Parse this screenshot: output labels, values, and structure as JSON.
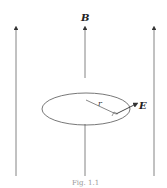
{
  "diagram": {
    "field_label": "B",
    "radius_label": "r",
    "efield_label": "E",
    "caption": "Fig. 1.1",
    "colors": {
      "line": "#555555",
      "text": "#222222"
    }
  }
}
